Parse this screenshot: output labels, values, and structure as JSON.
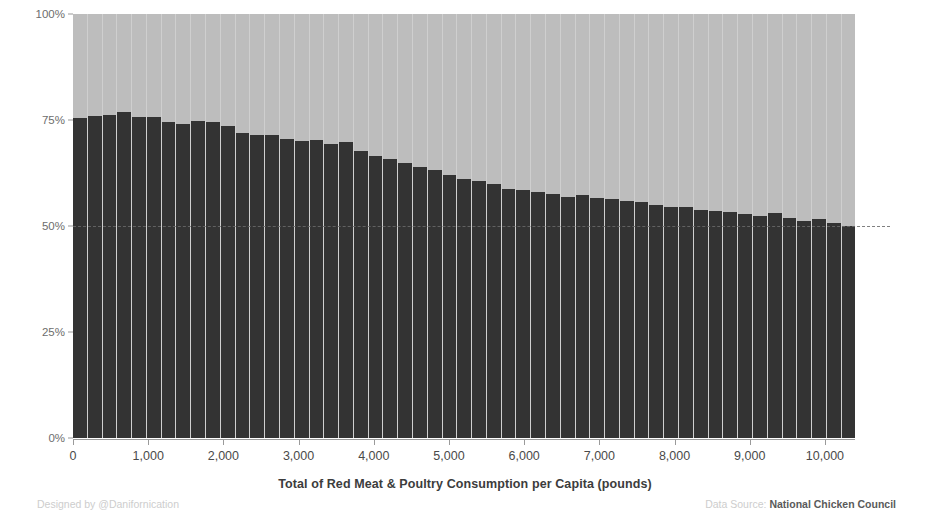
{
  "chart_data": {
    "type": "bar",
    "title": "",
    "subtitle": "",
    "xlabel": "Total of Red Meat & Poultry Consumption per Capita (pounds)",
    "ylabel": "",
    "xlim": [
      0,
      10400
    ],
    "ylim": [
      0,
      100
    ],
    "grid": false,
    "legend_position": "none",
    "x_tick_labels": [
      "0",
      "1,000",
      "2,000",
      "3,000",
      "4,000",
      "5,000",
      "6,000",
      "7,000",
      "8,000",
      "9,000",
      "10,000"
    ],
    "x_tick_values": [
      0,
      1000,
      2000,
      3000,
      4000,
      5000,
      6000,
      7000,
      8000,
      9000,
      10000
    ],
    "y_tick_labels": [
      "0%",
      "25%",
      "50%",
      "75%",
      "100%"
    ],
    "y_tick_values": [
      0,
      25,
      50,
      75,
      100
    ],
    "reference_line": {
      "value": 50,
      "style": "dashed",
      "color": "#6b6b6b"
    },
    "stacked": true,
    "colors": {
      "dark_series": "#333333",
      "light_series": "#bdbdbd",
      "background": "#ffffff"
    },
    "series": [
      {
        "name": "Red Meat share",
        "color": "#333333",
        "values": [
          75.5,
          76.0,
          76.2,
          76.8,
          75.8,
          75.6,
          74.6,
          74.0,
          74.8,
          74.6,
          73.6,
          72.0,
          71.5,
          71.4,
          70.6,
          70.0,
          70.2,
          69.4,
          69.8,
          67.6,
          66.4,
          65.8,
          64.8,
          64.0,
          63.2,
          62.0,
          61.0,
          60.6,
          59.8,
          58.8,
          58.4,
          58.0,
          57.6,
          56.8,
          57.4,
          56.6,
          56.4,
          56.0,
          55.6,
          55.0,
          54.6,
          54.4,
          53.8,
          53.6,
          53.2,
          52.8,
          52.4,
          53.0,
          52.0,
          51.2,
          51.6,
          50.6,
          50.0
        ]
      },
      {
        "name": "Poultry share",
        "color": "#bdbdbd",
        "values": [
          24.5,
          24.0,
          23.8,
          23.2,
          24.2,
          24.4,
          25.4,
          26.0,
          25.2,
          25.4,
          26.4,
          28.0,
          28.5,
          28.6,
          29.4,
          30.0,
          29.8,
          30.6,
          30.2,
          32.4,
          33.6,
          34.2,
          35.2,
          36.0,
          36.8,
          38.0,
          39.0,
          39.4,
          40.2,
          41.2,
          41.6,
          42.0,
          42.4,
          43.2,
          42.6,
          43.4,
          43.6,
          44.0,
          44.4,
          45.0,
          45.4,
          45.6,
          46.2,
          46.4,
          46.8,
          47.2,
          47.6,
          47.0,
          48.0,
          48.8,
          48.4,
          49.4,
          50.0
        ]
      }
    ]
  },
  "footer": {
    "designed_by": "Designed by @Danifornication",
    "data_source_label": "Data Source:",
    "data_source_name": "National Chicken Council"
  }
}
